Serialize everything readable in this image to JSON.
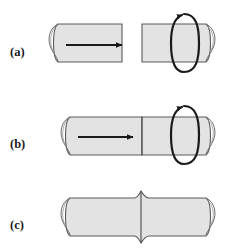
{
  "figure": {
    "background_color": "#ffffff",
    "body_fill_color": "#e3e3e3",
    "body_stroke_color": "#5a5a5a",
    "arrow_color": "#1a1a1a",
    "label_color": "#1a1a1a"
  },
  "rows": [
    {
      "id": "a",
      "label": "(a)",
      "caption_x": 20,
      "caption_y": 56,
      "axial_force_arrow": {
        "name": "axial-force-arrow",
        "direction": "right",
        "x1": 66,
        "x2": 124,
        "y": 45
      },
      "rotation_arrow": {
        "name": "rotation-arrow",
        "direction": "clockwise",
        "cx": 188,
        "cy": 43,
        "rx": 12,
        "ry": 31
      },
      "left_cylinder": {
        "name": "left-cylinder",
        "x": 50,
        "y": 24,
        "width": 72,
        "height": 38,
        "end_cap": "left"
      },
      "right_cylinder": {
        "name": "right-cylinder",
        "x": 142,
        "y": 24,
        "width": 72,
        "height": 38,
        "end_cap": "right"
      }
    },
    {
      "id": "b",
      "label": "(b)",
      "caption_x": 20,
      "caption_y": 147,
      "axial_force_arrow": {
        "name": "axial-force-arrow",
        "direction": "right",
        "x1": 78,
        "x2": 135,
        "y": 137,
        "is_contact": true
      },
      "rotation_arrow": {
        "name": "rotation-arrow",
        "direction": "clockwise",
        "cx": 188,
        "cy": 135,
        "rx": 12,
        "ry": 31
      },
      "left_cylinder": {
        "name": "left-cylinder",
        "x": 62,
        "y": 117,
        "width": 80,
        "height": 38,
        "end_cap": "left"
      },
      "right_cylinder": {
        "name": "right-cylinder",
        "x": 142,
        "y": 117,
        "width": 72,
        "height": 38,
        "end_cap": "right"
      },
      "interface_seam": {
        "name": "interface-seam-line",
        "x": 142,
        "y_top": 117,
        "y_bottom": 155
      }
    },
    {
      "id": "c",
      "label": "(c)",
      "caption_x": 20,
      "caption_y": 228,
      "welded_bar": {
        "name": "welded-bar",
        "x": 62,
        "y": 198,
        "width": 152,
        "height": 38,
        "weld_x": 142,
        "flash_height": 7,
        "flash_width": 14
      },
      "weld_seam": {
        "name": "weld-seam-line",
        "x": 142,
        "y_top": 191,
        "y_bottom": 243
      }
    }
  ]
}
